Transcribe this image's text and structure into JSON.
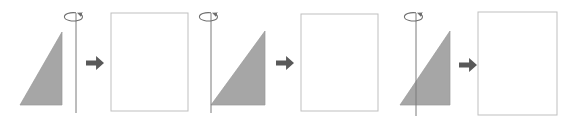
{
  "figure": {
    "width": 578,
    "height": 123,
    "background_color": "#ffffff",
    "colors": {
      "triangle_fill": "#a6a6a6",
      "triangle_stroke": "#9a9a9a",
      "axis_line": "#7a7a7a",
      "rotation_marker": "#6e6e6e",
      "block_arrow": "#595959",
      "result_box_border": "#bfbfbf",
      "result_box_fill": "#ffffff"
    }
  },
  "groups": [
    {
      "id": "group-1",
      "label": "Triangle with axis to the right of the figure",
      "triangle": {
        "label": "right triangle, right angle at bottom right",
        "points": "20,105 62,105 62,32",
        "vertices": [
          {
            "name": "bottom-left",
            "x": 20,
            "y": 105
          },
          {
            "name": "bottom-right",
            "x": 62,
            "y": 105
          },
          {
            "name": "top-right",
            "x": 62,
            "y": 32
          }
        ]
      },
      "axis": {
        "label": "vertical rotation axis",
        "x": 76,
        "y_top": 13,
        "y_bottom": 113
      },
      "rotation_marker": {
        "label": "rotation direction ellipse with arrowhead",
        "cx": 76,
        "cy": 17,
        "rx": 9,
        "ry": 4.2
      },
      "block_arrow": {
        "label": "yields arrow pointing right",
        "x": 86,
        "y": 56,
        "width": 18,
        "height": 14
      },
      "result_box": {
        "label": "resulting solid outline rectangle",
        "x": 111,
        "y": 13,
        "width": 77,
        "height": 98
      }
    },
    {
      "id": "group-2",
      "label": "Triangle with axis along its left vertex",
      "triangle": {
        "label": "right triangle, right angle at bottom right",
        "points": "211,105 265,105 265,31",
        "vertices": [
          {
            "name": "bottom-left",
            "x": 211,
            "y": 105
          },
          {
            "name": "bottom-right",
            "x": 265,
            "y": 105
          },
          {
            "name": "top-right",
            "x": 265,
            "y": 31
          }
        ]
      },
      "axis": {
        "label": "vertical rotation axis",
        "x": 211,
        "y_top": 13,
        "y_bottom": 113
      },
      "rotation_marker": {
        "label": "rotation direction ellipse with arrowhead",
        "cx": 211,
        "cy": 17,
        "rx": 9,
        "ry": 4.2
      },
      "block_arrow": {
        "label": "yields arrow pointing right",
        "x": 276,
        "y": 56,
        "width": 18,
        "height": 14
      },
      "result_box": {
        "label": "resulting solid outline rectangle",
        "x": 301,
        "y": 14,
        "width": 77,
        "height": 97
      }
    },
    {
      "id": "group-3",
      "label": "Triangle with axis passing through its interior",
      "triangle": {
        "label": "right triangle, right angle at bottom right",
        "points": "400,105 450,105 450,31",
        "vertices": [
          {
            "name": "bottom-left",
            "x": 400,
            "y": 105
          },
          {
            "name": "bottom-right",
            "x": 450,
            "y": 105
          },
          {
            "name": "top-right",
            "x": 450,
            "y": 31
          }
        ]
      },
      "axis": {
        "label": "vertical rotation axis",
        "x": 416,
        "y_top": 13,
        "y_bottom": 116
      },
      "rotation_marker": {
        "label": "rotation direction ellipse with arrowhead",
        "cx": 416,
        "cy": 17,
        "rx": 9,
        "ry": 4.2
      },
      "block_arrow": {
        "label": "yields arrow pointing right",
        "x": 459,
        "y": 58,
        "width": 18,
        "height": 14
      },
      "result_box": {
        "label": "resulting solid outline rectangle",
        "x": 478,
        "y": 12,
        "width": 79,
        "height": 103
      }
    }
  ],
  "accessibility": {
    "description": "Three panels, each showing a shaded right triangle beside a vertical rotation axis marked with a circular arrow, an arrow pointing right, and an empty rectangle representing the resulting solid."
  }
}
